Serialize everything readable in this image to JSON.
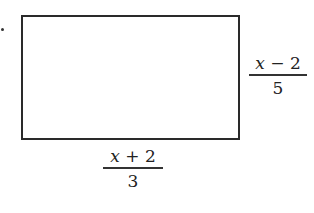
{
  "figure": {
    "bullet": "•",
    "shape": "rectangle",
    "labels": {
      "right_side": {
        "numerator_var": "x",
        "numerator_rest": " − 2",
        "denominator": "5"
      },
      "bottom_side": {
        "numerator_var": "x",
        "numerator_rest": " + 2",
        "denominator": "3"
      }
    }
  }
}
